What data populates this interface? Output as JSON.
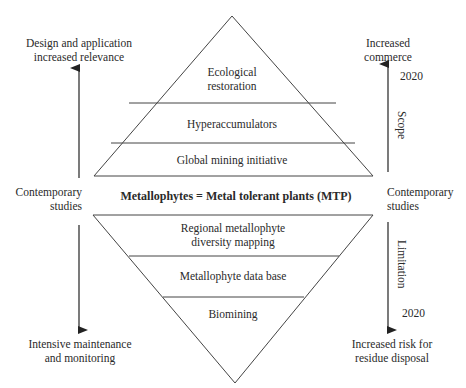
{
  "title": "Metallophytes = Metal tolerant plants (MTP)",
  "upper_pyramid": {
    "tiers": [
      {
        "label_line1": "Ecological",
        "label_line2": "restoration"
      },
      {
        "label": "Hyperaccumulators"
      },
      {
        "label": "Global mining initiative"
      }
    ]
  },
  "lower_pyramid": {
    "tiers": [
      {
        "label_line1": "Regional metallophyte",
        "label_line2": "diversity mapping"
      },
      {
        "label": "Metallophyte data base"
      },
      {
        "label": "Biomining"
      }
    ]
  },
  "left_axis": {
    "top_line1": "Design and application",
    "top_line2": "increased relevance",
    "middle_line1": "Contemporary",
    "middle_line2": "studies",
    "bottom_line1": "Intensive maintenance",
    "bottom_line2": "and monitoring"
  },
  "right_axis": {
    "top_line1": "Increased",
    "top_line2": "commerce",
    "top_year": "2020",
    "up_label": "Scope",
    "middle_line1": "Contemporary",
    "middle_line2": "studies",
    "down_label": "Limitation",
    "bottom_year": "2020",
    "bottom_line1": "Increased risk for",
    "bottom_line2": "residue disposal"
  },
  "colors": {
    "line": "#333333",
    "text": "#2a2a2a",
    "background": "#ffffff"
  }
}
